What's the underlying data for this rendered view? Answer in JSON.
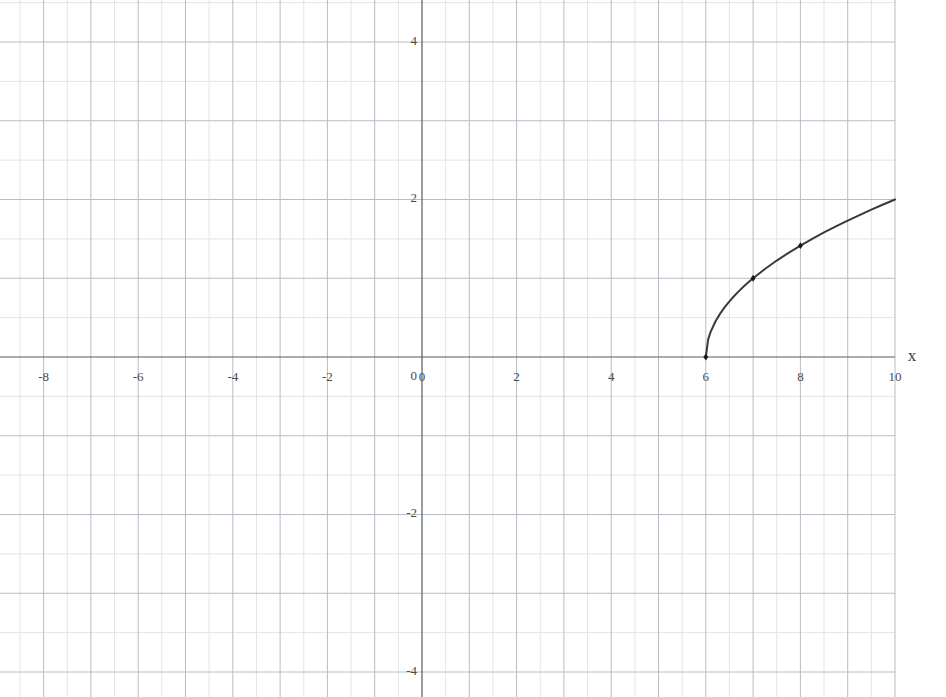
{
  "chart_data": {
    "type": "line",
    "title": "",
    "subtitle": "",
    "xlabel": "x",
    "ylabel": "",
    "xlim": [
      -10,
      10
    ],
    "ylim": [
      -4.4,
      4.4
    ],
    "grid": true,
    "grid_major_step": 1,
    "grid_minor_step": 0.5,
    "legend": "none",
    "xticks": [
      -10,
      -8,
      -6,
      -4,
      -2,
      0,
      2,
      4,
      6,
      8,
      10
    ],
    "xtick_labels": [
      "-10",
      "-8",
      "-6",
      "-4",
      "-2",
      "0",
      "2",
      "4",
      "6",
      "8",
      "10"
    ],
    "yticks": [
      -4,
      -2,
      0,
      2,
      4
    ],
    "ytick_labels": [
      "-4",
      "-2",
      "0",
      "2",
      "4"
    ],
    "series": [
      {
        "name": "y = sqrt(x - 6)",
        "color": "#3a3a3a",
        "line_width": 2,
        "domain_start": 6,
        "domain_end": 10,
        "x": [
          6,
          6.05,
          6.1,
          6.2,
          6.3,
          6.4,
          6.5,
          6.6,
          6.7,
          6.8,
          6.9,
          7,
          7.25,
          7.5,
          7.75,
          8,
          8.25,
          8.5,
          8.75,
          9,
          9.25,
          9.5,
          9.75,
          10
        ],
        "y": [
          0,
          0.2236,
          0.3162,
          0.4472,
          0.5477,
          0.6325,
          0.7071,
          0.7746,
          0.8367,
          0.8944,
          0.9487,
          1,
          1.118,
          1.2247,
          1.3229,
          1.4142,
          1.5,
          1.5811,
          1.6583,
          1.7321,
          1.8028,
          1.8708,
          1.9365,
          2
        ]
      }
    ],
    "markers": [
      {
        "x": 6,
        "y": 0,
        "label": ""
      },
      {
        "x": 7,
        "y": 1,
        "label": ""
      },
      {
        "x": 8,
        "y": 1.4142,
        "label": ""
      }
    ],
    "colors": {
      "curve": "#3a3a3a",
      "marker": "#1a1a1a",
      "axis": "#5a5a5a",
      "grid_major": "#b9bcc4",
      "grid_minor": "#e2e4e8",
      "background": "#ffffff",
      "tick_text": "#4a4a4a"
    }
  },
  "axes": {
    "x_axis_label": "x",
    "y_axis_label": ""
  }
}
